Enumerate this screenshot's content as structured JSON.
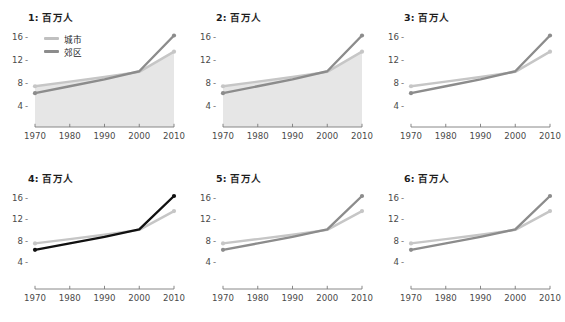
{
  "figure": {
    "width": 565,
    "height": 322,
    "background": "#ffffff",
    "panel_count": 6,
    "grid": "2 rows x 3 columns"
  },
  "legend": {
    "visible_in_panel": 1,
    "entries": [
      {
        "label": "城市",
        "color": "#c0c0c0",
        "series_key": "urban"
      },
      {
        "label": "郊区",
        "color": "#8c8c8c",
        "series_key": "suburb"
      }
    ]
  },
  "axes": {
    "y_ticks": [
      "16",
      "12",
      "8",
      "4"
    ],
    "y_tick_values": [
      16,
      12,
      8,
      4
    ],
    "y_dash": "-",
    "ylim": [
      2,
      17.6
    ],
    "x_ticks": [
      "1970",
      "1980",
      "1990",
      "2000",
      "2010"
    ],
    "x_tick_values": [
      1970,
      1980,
      1990,
      2000,
      2010
    ],
    "xlim": [
      1970,
      2010
    ],
    "grid": "off",
    "axis_line_color": "#7a7a7a"
  },
  "colors": {
    "urban_light": "#c6c6c6",
    "suburb_gray": "#8c8c8c",
    "suburb_black": "#111111",
    "area_fill": "#e6e6e6",
    "text": "#3a3a3a",
    "title_text": "#1c1c1c"
  },
  "chart_data": {
    "type": "line",
    "title": "百万人",
    "xlabel": "",
    "ylabel": "百万人",
    "x": [
      1970,
      1980,
      1990,
      2000,
      2010
    ],
    "xlim": [
      1970,
      2010
    ],
    "ylim": [
      2,
      17.6
    ],
    "yticks": [
      4,
      8,
      12,
      16
    ],
    "grid": false,
    "legend_position": "upper-left (panel 1 only)",
    "panels": [
      {
        "id": 1,
        "title": "1: 百万人",
        "show_legend": true,
        "area_fill": true,
        "suburb_color_key": "suburb_gray",
        "series": [
          {
            "name": "城市",
            "key": "urban",
            "color": "#c6c6c6",
            "values": [
              7.5,
              8.3,
              9.1,
              10.0,
              13.5
            ]
          },
          {
            "name": "郊区",
            "key": "suburb",
            "color": "#8c8c8c",
            "values": [
              6.3,
              7.5,
              8.7,
              10.1,
              16.3
            ]
          }
        ]
      },
      {
        "id": 2,
        "title": "2: 百万人",
        "show_legend": false,
        "area_fill": true,
        "suburb_color_key": "suburb_gray",
        "series": [
          {
            "name": "城市",
            "key": "urban",
            "color": "#c6c6c6",
            "values": [
              7.5,
              8.3,
              9.1,
              10.0,
              13.5
            ]
          },
          {
            "name": "郊区",
            "key": "suburb",
            "color": "#8c8c8c",
            "values": [
              6.3,
              7.5,
              8.7,
              10.1,
              16.3
            ]
          }
        ]
      },
      {
        "id": 3,
        "title": "3: 百万人",
        "show_legend": false,
        "area_fill": false,
        "suburb_color_key": "suburb_gray",
        "series": [
          {
            "name": "城市",
            "key": "urban",
            "color": "#c6c6c6",
            "values": [
              7.5,
              8.3,
              9.1,
              10.0,
              13.5
            ]
          },
          {
            "name": "郊区",
            "key": "suburb",
            "color": "#8c8c8c",
            "values": [
              6.3,
              7.5,
              8.7,
              10.1,
              16.3
            ]
          }
        ]
      },
      {
        "id": 4,
        "title": "4: 百万人",
        "show_legend": false,
        "area_fill": false,
        "suburb_color_key": "suburb_black",
        "series": [
          {
            "name": "城市",
            "key": "urban",
            "color": "#c6c6c6",
            "values": [
              7.5,
              8.3,
              9.1,
              10.0,
              13.5
            ]
          },
          {
            "name": "郊区",
            "key": "suburb",
            "color": "#111111",
            "values": [
              6.3,
              7.5,
              8.7,
              10.1,
              16.3
            ]
          }
        ]
      },
      {
        "id": 5,
        "title": "5: 百万人",
        "show_legend": false,
        "area_fill": false,
        "suburb_color_key": "suburb_gray",
        "series": [
          {
            "name": "城市",
            "key": "urban",
            "color": "#c6c6c6",
            "values": [
              7.5,
              8.3,
              9.1,
              10.0,
              13.5
            ]
          },
          {
            "name": "郊区",
            "key": "suburb",
            "color": "#8c8c8c",
            "values": [
              6.3,
              7.5,
              8.7,
              10.1,
              16.3
            ]
          }
        ]
      },
      {
        "id": 6,
        "title": "6: 百万人",
        "show_legend": false,
        "area_fill": false,
        "suburb_color_key": "suburb_gray",
        "series": [
          {
            "name": "城市",
            "key": "urban",
            "color": "#c6c6c6",
            "values": [
              7.5,
              8.3,
              9.1,
              10.0,
              13.5
            ]
          },
          {
            "name": "郊区",
            "key": "suburb",
            "color": "#8c8c8c",
            "values": [
              6.3,
              7.5,
              8.7,
              10.1,
              16.3
            ]
          }
        ]
      }
    ]
  }
}
